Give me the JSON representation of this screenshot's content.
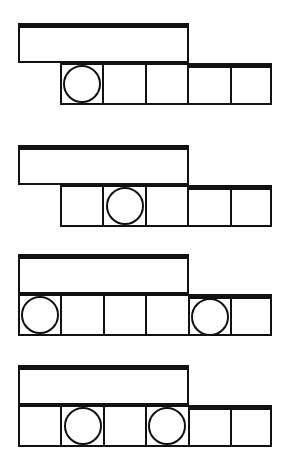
{
  "worksheet": {
    "title": "Word Scramble Worksheet",
    "style": {
      "ink": "#111111",
      "paper": "#ffffff"
    },
    "rows": [
      {
        "index": 1,
        "word": "KOVEE",
        "word_box": {
          "x": 18,
          "y": 23,
          "width": 171,
          "height": 40
        },
        "text_pos": {
          "x": 18,
          "y": 29,
          "width": 171
        },
        "grid": {
          "x": 60,
          "y": 63,
          "cells": 5,
          "cell_width": 42.4,
          "cell_height": 42,
          "circles": [
            1
          ],
          "thick_top_from_cell": 4
        }
      },
      {
        "index": 2,
        "word": "ILFOO",
        "word_box": {
          "x": 18,
          "y": 145,
          "width": 171,
          "height": 40
        },
        "text_pos": {
          "x": 18,
          "y": 151,
          "width": 171
        },
        "grid": {
          "x": 60,
          "y": 185,
          "cells": 5,
          "cell_width": 42.4,
          "cell_height": 42,
          "circles": [
            2
          ],
          "thick_top_from_cell": 4
        }
      },
      {
        "index": 3,
        "word": "ENGOPS",
        "word_box": {
          "x": 18,
          "y": 254,
          "width": 171,
          "height": 40
        },
        "text_pos": {
          "x": 18,
          "y": 260,
          "width": 171
        },
        "grid": {
          "x": 18,
          "y": 294,
          "cells": 6,
          "cell_width": 42.4,
          "cell_height": 42,
          "circles": [
            1,
            5
          ],
          "thick_top_from_cell": 5
        }
      },
      {
        "index": 4,
        "word": "GICART",
        "word_box": {
          "x": 18,
          "y": 365,
          "width": 171,
          "height": 40
        },
        "text_pos": {
          "x": 18,
          "y": 371,
          "width": 171
        },
        "grid": {
          "x": 18,
          "y": 405,
          "cells": 6,
          "cell_width": 42.4,
          "cell_height": 42,
          "circles": [
            2,
            4
          ],
          "thick_top_from_cell": 5
        }
      }
    ]
  }
}
